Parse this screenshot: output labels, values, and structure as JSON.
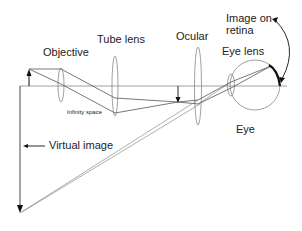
{
  "diagram": {
    "labels": {
      "objective": "Objective",
      "tube_lens": "Tube lens",
      "ocular": "Ocular",
      "image_on_retina": "Image on\nretina",
      "image_on_retina_line1": "Image on",
      "image_on_retina_line2": "retina",
      "eye_lens": "Eye lens",
      "infinity_space": "Infinity space",
      "virtual_image": "Virtual image",
      "eye": "Eye"
    },
    "components": [
      "object-arrow",
      "objective-lens",
      "tube-lens",
      "intermediate-image-arrow",
      "ocular-lens",
      "eye-lens",
      "eyeball",
      "retina-image",
      "virtual-image-arrow"
    ],
    "colors": {
      "lines": "#555555",
      "lens_outline": "#888888",
      "arrow": "#111111",
      "text": "#222222"
    }
  }
}
